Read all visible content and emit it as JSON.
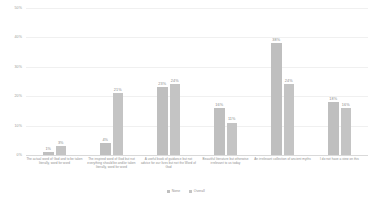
{
  "chart_data": {
    "type": "bar",
    "title": "",
    "xlabel": "",
    "ylabel": "",
    "ylim": [
      0,
      50
    ],
    "yticks": [
      "0%",
      "10%",
      "20%",
      "30%",
      "40%",
      "50%"
    ],
    "ytick_values": [
      0,
      10,
      20,
      30,
      40,
      50
    ],
    "grid": true,
    "legend_position": "bottom",
    "categories": [
      "The actual word of God and to be taken literally, word for word",
      "The inspired word of God but not everything should be and/or taken literally, word for word",
      "A useful book of guidance but not advice for our lives but not the Word of God",
      "Beautiful literature but otherwise irrelevant to us today",
      "An irrelevant collection of ancient myths",
      "I do not have a view on this"
    ],
    "series": [
      {
        "name": "None",
        "color": "#bfbfbf",
        "values": [
          1,
          4,
          23,
          16,
          38,
          18
        ],
        "labels": [
          "1%",
          "4%",
          "23%",
          "16%",
          "38%",
          "18%"
        ]
      },
      {
        "name": "Overall",
        "color": "#c4c4c4",
        "values": [
          3,
          21,
          24,
          11,
          24,
          16
        ],
        "labels": [
          "3%",
          "21%",
          "24%",
          "11%",
          "24%",
          "16%"
        ]
      }
    ]
  }
}
